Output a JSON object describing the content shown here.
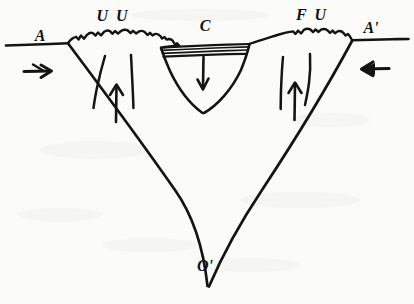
{
  "figure": {
    "background_color": "#fbfbf9",
    "ink_color": "#141414",
    "width": 414,
    "height": 304
  },
  "labels": {
    "left_endpoint": "A",
    "right_endpoint": "A'",
    "left_uplift": "U U",
    "right_uplift": "F U",
    "center_block": "C",
    "apex": "O'"
  },
  "label_positions": {
    "left_endpoint": {
      "x": 40,
      "y": 41
    },
    "right_endpoint": {
      "x": 371,
      "y": 33
    },
    "left_uplift": {
      "x": 113,
      "y": 21
    },
    "right_uplift": {
      "x": 312,
      "y": 20
    },
    "center_block": {
      "x": 205,
      "y": 31
    },
    "apex": {
      "x": 205,
      "y": 271
    }
  },
  "arrows": {
    "left_compression": {
      "name": "left-compression-arrow",
      "direction": "right",
      "symbol": "→",
      "x": 26,
      "y": 71,
      "length": 26
    },
    "right_compression": {
      "name": "right-compression-arrow",
      "direction": "left",
      "symbol": "←",
      "x": 388,
      "y": 68,
      "length": 26
    },
    "left_uplift_arrow": {
      "name": "left-uplift-arrow",
      "direction": "up",
      "symbol": "↑",
      "x": 116,
      "y": 105,
      "length": 30
    },
    "right_uplift_arrow": {
      "name": "right-uplift-arrow",
      "direction": "up",
      "symbol": "↑",
      "x": 295,
      "y": 103,
      "length": 30
    },
    "center_subsidence_arrow": {
      "name": "center-subsidence-arrow",
      "direction": "down",
      "symbol": "↓",
      "x": 203,
      "y": 70,
      "length": 28
    }
  },
  "geometry": {
    "ground_line_left": {
      "x1": 6,
      "y1": 45,
      "x2": 68,
      "y2": 43
    },
    "ground_line_right": {
      "x1": 352,
      "y1": 40,
      "x2": 408,
      "y2": 39
    },
    "v_apex": {
      "x": 208,
      "y": 286
    },
    "v_left_top": {
      "x": 68,
      "y": 43
    },
    "v_right_top": {
      "x": 352,
      "y": 40
    },
    "graben_top_left": {
      "x": 161,
      "y": 48
    },
    "graben_top_right": {
      "x": 249,
      "y": 44
    },
    "graben_bottom": {
      "x": 203,
      "y": 112
    },
    "strata_line_count": 3
  },
  "description": {
    "structure_type": "graben / rift valley cross-section",
    "features": [
      "serrated topographic surface on uplifted flanks",
      "two bounding normal faults on each flank",
      "central down-dropped block with layered strata",
      "convergent V-shaped deep structure meeting at apex"
    ]
  }
}
